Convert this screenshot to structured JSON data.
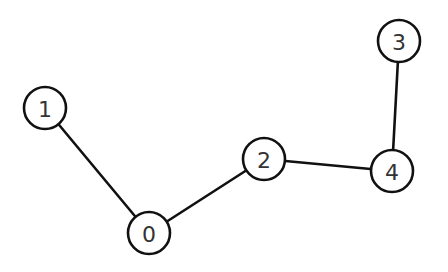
{
  "graph": {
    "node_radius": 21,
    "nodes": [
      {
        "id": "0",
        "label": "0",
        "x": 149,
        "y": 233
      },
      {
        "id": "1",
        "label": "1",
        "x": 45,
        "y": 108
      },
      {
        "id": "2",
        "label": "2",
        "x": 264,
        "y": 159
      },
      {
        "id": "3",
        "label": "3",
        "x": 399,
        "y": 41
      },
      {
        "id": "4",
        "label": "4",
        "x": 392,
        "y": 171
      }
    ],
    "edges": [
      {
        "source": "1",
        "target": "0"
      },
      {
        "source": "0",
        "target": "2"
      },
      {
        "source": "2",
        "target": "4"
      },
      {
        "source": "4",
        "target": "3"
      }
    ]
  }
}
